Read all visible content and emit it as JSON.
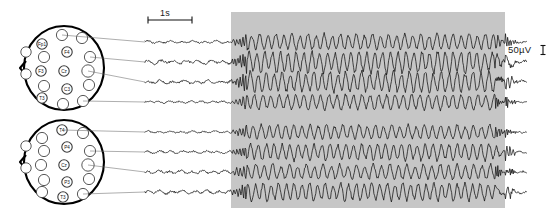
{
  "figure": {
    "kind": "eeg-recording-figure",
    "background_color": "#ffffff",
    "trace_color": "#111111",
    "shaded_region_color": "#c6c6c6",
    "head_outline_color": "#000000",
    "electrode_fill": "#ffffff"
  },
  "scales": {
    "time": {
      "label": "1s",
      "bar_x1": 148,
      "bar_x2": 192,
      "bar_y": 20
    },
    "amplitude": {
      "label": "50µV",
      "tick_x": 543,
      "tick_y": 50,
      "tick_height": 9
    }
  },
  "shaded_region": {
    "name": "seizure-activity-window",
    "x": 231,
    "y": 12,
    "width": 274,
    "height": 196
  },
  "heads": [
    {
      "name": "head-map-upper",
      "cx": 64,
      "cy": 68,
      "rx": 40,
      "ry": 42,
      "electrodes": [
        {
          "label": "Fp1",
          "x": 42,
          "y": 44,
          "r": 5.2,
          "labeled": true
        },
        {
          "label": "",
          "x": 62,
          "y": 35,
          "r": 5.6,
          "labeled": false
        },
        {
          "label": "",
          "x": 82,
          "y": 38,
          "r": 5.6,
          "labeled": false
        },
        {
          "label": "F4",
          "x": 67,
          "y": 52,
          "r": 5.2,
          "labeled": true
        },
        {
          "label": "",
          "x": 44,
          "y": 57,
          "r": 5.6,
          "labeled": false
        },
        {
          "label": "",
          "x": 90,
          "y": 57,
          "r": 5.6,
          "labeled": false
        },
        {
          "label": "",
          "x": 26,
          "y": 52,
          "r": 5.2,
          "labeled": false
        },
        {
          "label": "F3",
          "x": 41,
          "y": 71,
          "r": 5.2,
          "labeled": true
        },
        {
          "label": "Cz",
          "x": 64,
          "y": 71,
          "r": 5.2,
          "labeled": true
        },
        {
          "label": "",
          "x": 88,
          "y": 71,
          "r": 6.2,
          "labeled": false
        },
        {
          "label": "",
          "x": 26,
          "y": 74,
          "r": 5.2,
          "labeled": false
        },
        {
          "label": "",
          "x": 44,
          "y": 86,
          "r": 5.6,
          "labeled": false
        },
        {
          "label": "C3",
          "x": 67,
          "y": 89,
          "r": 5.2,
          "labeled": true
        },
        {
          "label": "",
          "x": 89,
          "y": 85,
          "r": 5.6,
          "labeled": false
        },
        {
          "label": "T3",
          "x": 42,
          "y": 98,
          "r": 5.2,
          "labeled": true
        },
        {
          "label": "",
          "x": 63,
          "y": 104,
          "r": 5.6,
          "labeled": false
        },
        {
          "label": "",
          "x": 83,
          "y": 101,
          "r": 5.6,
          "labeled": false
        }
      ],
      "connections": [
        {
          "from_x": 62,
          "from_y": 35,
          "to_x": 145,
          "to_y": 42
        },
        {
          "from_x": 90,
          "from_y": 57,
          "to_x": 145,
          "to_y": 62
        },
        {
          "from_x": 88,
          "from_y": 71,
          "to_x": 145,
          "to_y": 82
        },
        {
          "from_x": 83,
          "from_y": 101,
          "to_x": 145,
          "to_y": 102
        }
      ]
    },
    {
      "name": "head-map-lower",
      "cx": 64,
      "cy": 162,
      "rx": 40,
      "ry": 42,
      "electrodes": [
        {
          "label": "T4",
          "x": 62,
          "y": 130,
          "r": 5.2,
          "labeled": true
        },
        {
          "label": "",
          "x": 42,
          "y": 138,
          "r": 5.6,
          "labeled": false
        },
        {
          "label": "",
          "x": 83,
          "y": 133,
          "r": 5.6,
          "labeled": false
        },
        {
          "label": "P4",
          "x": 67,
          "y": 147,
          "r": 5.2,
          "labeled": true
        },
        {
          "label": "",
          "x": 44,
          "y": 151,
          "r": 5.6,
          "labeled": false
        },
        {
          "label": "",
          "x": 90,
          "y": 151,
          "r": 5.6,
          "labeled": false
        },
        {
          "label": "",
          "x": 26,
          "y": 146,
          "r": 5.2,
          "labeled": false
        },
        {
          "label": "",
          "x": 41,
          "y": 165,
          "r": 5.6,
          "labeled": false
        },
        {
          "label": "Cz",
          "x": 64,
          "y": 165,
          "r": 5.2,
          "labeled": true
        },
        {
          "label": "",
          "x": 88,
          "y": 165,
          "r": 6.2,
          "labeled": false
        },
        {
          "label": "",
          "x": 26,
          "y": 168,
          "r": 5.2,
          "labeled": false
        },
        {
          "label": "",
          "x": 44,
          "y": 180,
          "r": 5.6,
          "labeled": false
        },
        {
          "label": "P3",
          "x": 67,
          "y": 182,
          "r": 5.2,
          "labeled": true
        },
        {
          "label": "",
          "x": 89,
          "y": 179,
          "r": 5.6,
          "labeled": false
        },
        {
          "label": "",
          "x": 42,
          "y": 192,
          "r": 5.6,
          "labeled": false
        },
        {
          "label": "T3",
          "x": 63,
          "y": 197,
          "r": 5.2,
          "labeled": true
        },
        {
          "label": "",
          "x": 83,
          "y": 194,
          "r": 5.6,
          "labeled": false
        }
      ],
      "connections": [
        {
          "from_x": 62,
          "from_y": 130,
          "to_x": 145,
          "to_y": 132
        },
        {
          "from_x": 90,
          "from_y": 151,
          "to_x": 145,
          "to_y": 152
        },
        {
          "from_x": 88,
          "from_y": 165,
          "to_x": 145,
          "to_y": 172
        },
        {
          "from_x": 83,
          "from_y": 194,
          "to_x": 145,
          "to_y": 192
        }
      ]
    }
  ],
  "chart_data": {
    "type": "line",
    "title": "",
    "xlabel": "",
    "ylabel": "",
    "x_start": 145,
    "x_end": 527,
    "onset_x": 231,
    "offset_x": 505,
    "time_scale_seconds_per_px": 0.0227,
    "amplitude_scale_uv_per_px": 5.6,
    "series": [
      {
        "name": "trace-1",
        "baseline_y": 42,
        "group": "upper",
        "amp_pre": 1.6,
        "amp_ict": 7.0,
        "freq_pre": 0.55,
        "freq_ict": 0.78,
        "seed": 11
      },
      {
        "name": "trace-2",
        "baseline_y": 62,
        "group": "upper",
        "amp_pre": 2.3,
        "amp_ict": 9.5,
        "freq_pre": 0.5,
        "freq_ict": 0.8,
        "seed": 27
      },
      {
        "name": "trace-3",
        "baseline_y": 82,
        "group": "upper",
        "amp_pre": 2.0,
        "amp_ict": 9.0,
        "freq_pre": 0.52,
        "freq_ict": 0.79,
        "seed": 43
      },
      {
        "name": "trace-4",
        "baseline_y": 102,
        "group": "upper",
        "amp_pre": 1.5,
        "amp_ict": 6.8,
        "freq_pre": 0.58,
        "freq_ict": 0.76,
        "seed": 59
      },
      {
        "name": "trace-5",
        "baseline_y": 132,
        "group": "lower",
        "amp_pre": 1.4,
        "amp_ict": 6.2,
        "freq_pre": 0.56,
        "freq_ict": 0.77,
        "seed": 71
      },
      {
        "name": "trace-6",
        "baseline_y": 152,
        "group": "lower",
        "amp_pre": 1.8,
        "amp_ict": 7.4,
        "freq_pre": 0.54,
        "freq_ict": 0.79,
        "seed": 89
      },
      {
        "name": "trace-7",
        "baseline_y": 172,
        "group": "lower",
        "amp_pre": 2.1,
        "amp_ict": 6.6,
        "freq_pre": 0.57,
        "freq_ict": 0.75,
        "seed": 101
      },
      {
        "name": "trace-8",
        "baseline_y": 192,
        "group": "lower",
        "amp_pre": 2.2,
        "amp_ict": 7.8,
        "freq_pre": 0.53,
        "freq_ict": 0.81,
        "seed": 113
      }
    ]
  }
}
